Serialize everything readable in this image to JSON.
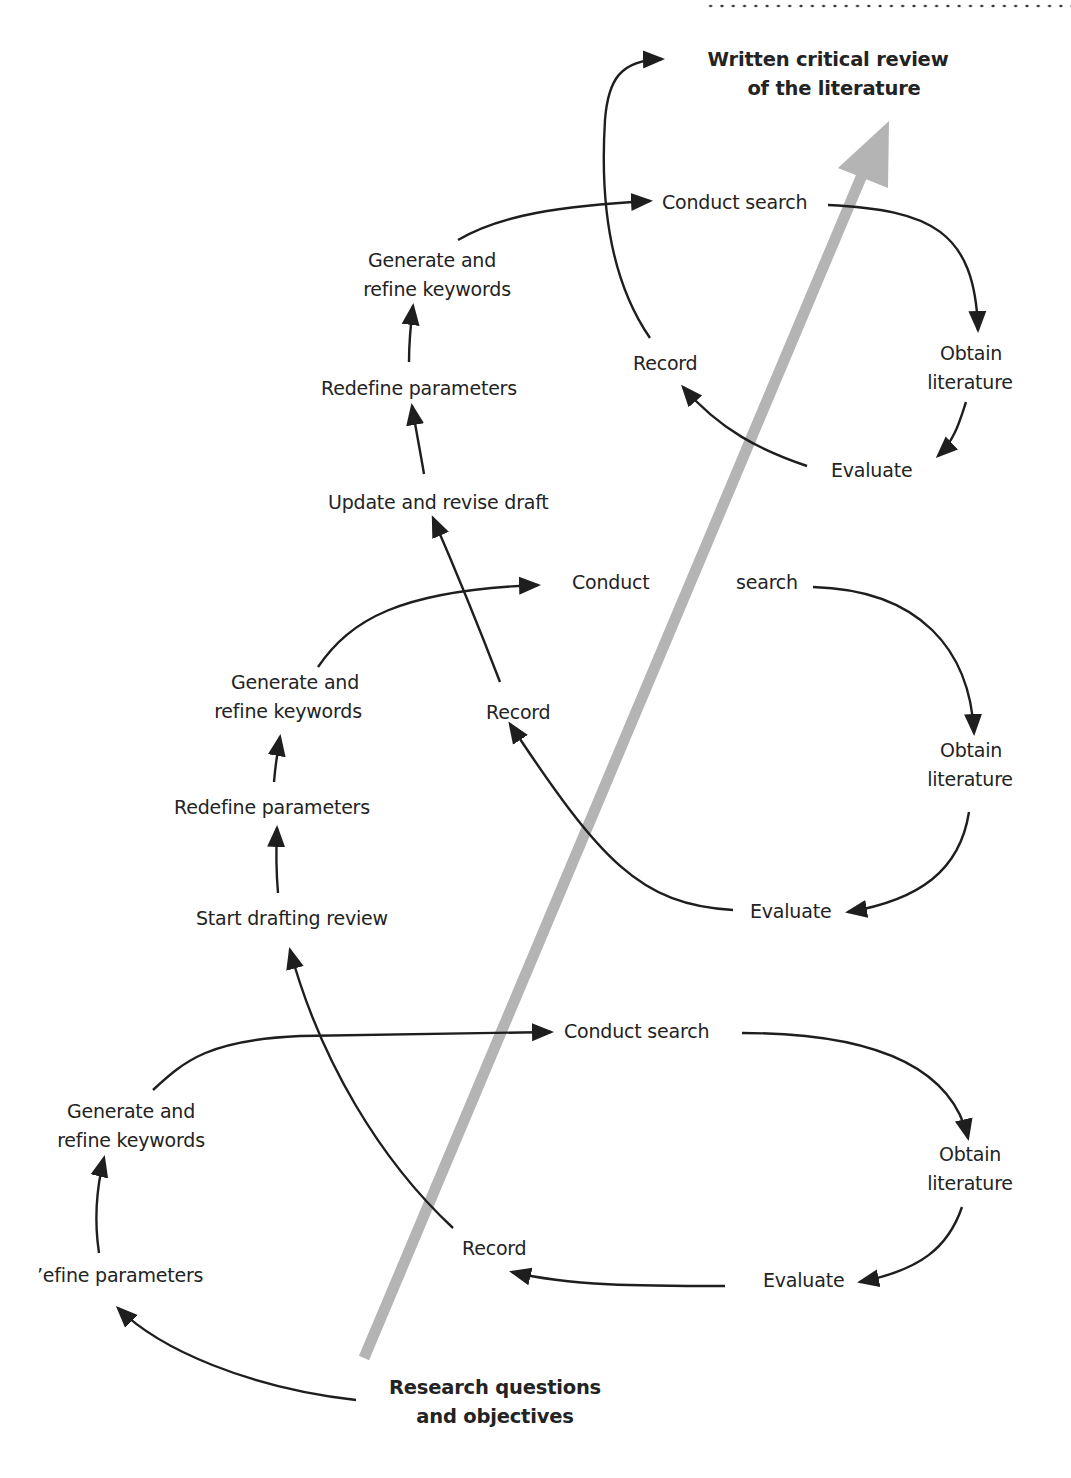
{
  "diagram": {
    "title_lines": [
      "Written critical review",
      "of the literature"
    ],
    "start": "Research questions and objectives",
    "start_lines": [
      "Research questions",
      "and objectives"
    ],
    "colors": {
      "text": "#232323",
      "arrow": "#1e1e1e",
      "progress_arrow": "#b4b4b4",
      "header_dots": "#333333"
    },
    "cycles": [
      {
        "name": "cycle-3-top",
        "conduct_search": "Conduct search",
        "obtain_literature": [
          "Obtain",
          "literature"
        ],
        "evaluate": "Evaluate",
        "record": "Record",
        "generate_keywords": [
          "Generate and",
          "refine keywords"
        ],
        "redefine_parameters": "Redefine parameters",
        "draft_step": "Update and revise draft"
      },
      {
        "name": "cycle-2-middle",
        "conduct_search": [
          "Conduct",
          "search"
        ],
        "obtain_literature": [
          "Obtain",
          "literature"
        ],
        "evaluate": "Evaluate",
        "record": "Record",
        "generate_keywords": [
          "Generate and",
          "refine keywords"
        ],
        "redefine_parameters": "Redefine parameters",
        "draft_step": "Start drafting review"
      },
      {
        "name": "cycle-1-bottom",
        "conduct_search": "Conduct search",
        "obtain_literature": [
          "Obtain",
          "literature"
        ],
        "evaluate": "Evaluate",
        "record": "Record",
        "generate_keywords": [
          "Generate and",
          "refine keywords"
        ],
        "define_parameters": "’efine parameters"
      }
    ],
    "edges": [
      [
        "Research questions and objectives",
        "Define parameters"
      ],
      [
        "Define parameters",
        "Generate and refine keywords (1)"
      ],
      [
        "Generate and refine keywords (1)",
        "Conduct search (1)"
      ],
      [
        "Conduct search (1)",
        "Obtain literature (1)"
      ],
      [
        "Obtain literature (1)",
        "Evaluate (1)"
      ],
      [
        "Evaluate (1)",
        "Record (1)"
      ],
      [
        "Record (1)",
        "Start drafting review"
      ],
      [
        "Start drafting review",
        "Redefine parameters (2)"
      ],
      [
        "Redefine parameters (2)",
        "Generate and refine keywords (2)"
      ],
      [
        "Generate and refine keywords (2)",
        "Conduct search (2)"
      ],
      [
        "Conduct search (2)",
        "Obtain literature (2)"
      ],
      [
        "Obtain literature (2)",
        "Evaluate (2)"
      ],
      [
        "Evaluate (2)",
        "Record (2)"
      ],
      [
        "Record (2)",
        "Update and revise draft"
      ],
      [
        "Update and revise draft",
        "Redefine parameters (3)"
      ],
      [
        "Redefine parameters (3)",
        "Generate and refine keywords (3)"
      ],
      [
        "Generate and refine keywords (3)",
        "Conduct search (3)"
      ],
      [
        "Conduct search (3)",
        "Obtain literature (3)"
      ],
      [
        "Obtain literature (3)",
        "Evaluate (3)"
      ],
      [
        "Evaluate (3)",
        "Record (3)"
      ],
      [
        "Record (3)",
        "Written critical review of the literature"
      ]
    ]
  }
}
